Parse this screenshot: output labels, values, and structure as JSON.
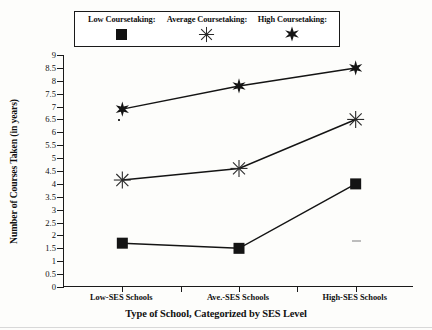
{
  "legend": {
    "items": [
      {
        "label": "Low Coursetaking:",
        "marker": "filled-square-marker"
      },
      {
        "label": "Average Coursetaking:",
        "marker": "asterisk-marker"
      },
      {
        "label": "High Coursetaking:",
        "marker": "filled-star-marker"
      }
    ]
  },
  "chart_data": {
    "type": "line",
    "title": "",
    "xlabel": "Type of School,  Categorized by SES Level",
    "ylabel": "Number of Courses Taken (in years)",
    "categories": [
      "Low-SES Schools",
      "Ave.-SES Schools",
      "High-SES Schools"
    ],
    "series": [
      {
        "name": "Low Coursetaking:",
        "marker": "filled-square-marker",
        "values": [
          1.7,
          1.5,
          4.0
        ]
      },
      {
        "name": "Average Coursetaking:",
        "marker": "asterisk-marker",
        "values": [
          4.15,
          4.6,
          6.5
        ]
      },
      {
        "name": "High Coursetaking:",
        "marker": "filled-star-marker",
        "values": [
          6.9,
          7.8,
          8.5
        ]
      }
    ],
    "ylim": [
      0,
      9
    ],
    "ytick_step": 0.5,
    "ytick_labels": [
      "0",
      "0.5",
      "1",
      "1.5",
      "2",
      "2.5",
      "3",
      "3.5",
      "4",
      "4.5",
      "5",
      "5.5",
      "6",
      "6.5",
      "7",
      "7.5",
      "8",
      "8.5",
      "9"
    ],
    "xtick_count": 5,
    "grid": false,
    "legend_position": "top"
  }
}
